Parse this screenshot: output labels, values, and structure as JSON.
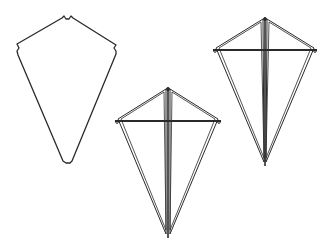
{
  "diagram": {
    "stroke_color": "#2a2a2a",
    "background": "#ffffff",
    "kites": [
      {
        "name": "kite-outline",
        "type": "sail-outline",
        "top": [
          67,
          17
        ],
        "left": [
          17,
          44
        ],
        "right": [
          117,
          46
        ],
        "bottom": [
          67,
          162
        ]
      },
      {
        "name": "kite-framed-middle",
        "type": "framed",
        "top": [
          168,
          89
        ],
        "left": [
          117,
          121
        ],
        "right": [
          219,
          121
        ],
        "bottom": [
          168,
          236
        ]
      },
      {
        "name": "kite-framed-right",
        "type": "framed",
        "top": [
          265,
          19
        ],
        "left": [
          215,
          50
        ],
        "right": [
          315,
          50
        ],
        "bottom": [
          265,
          164
        ]
      }
    ]
  }
}
